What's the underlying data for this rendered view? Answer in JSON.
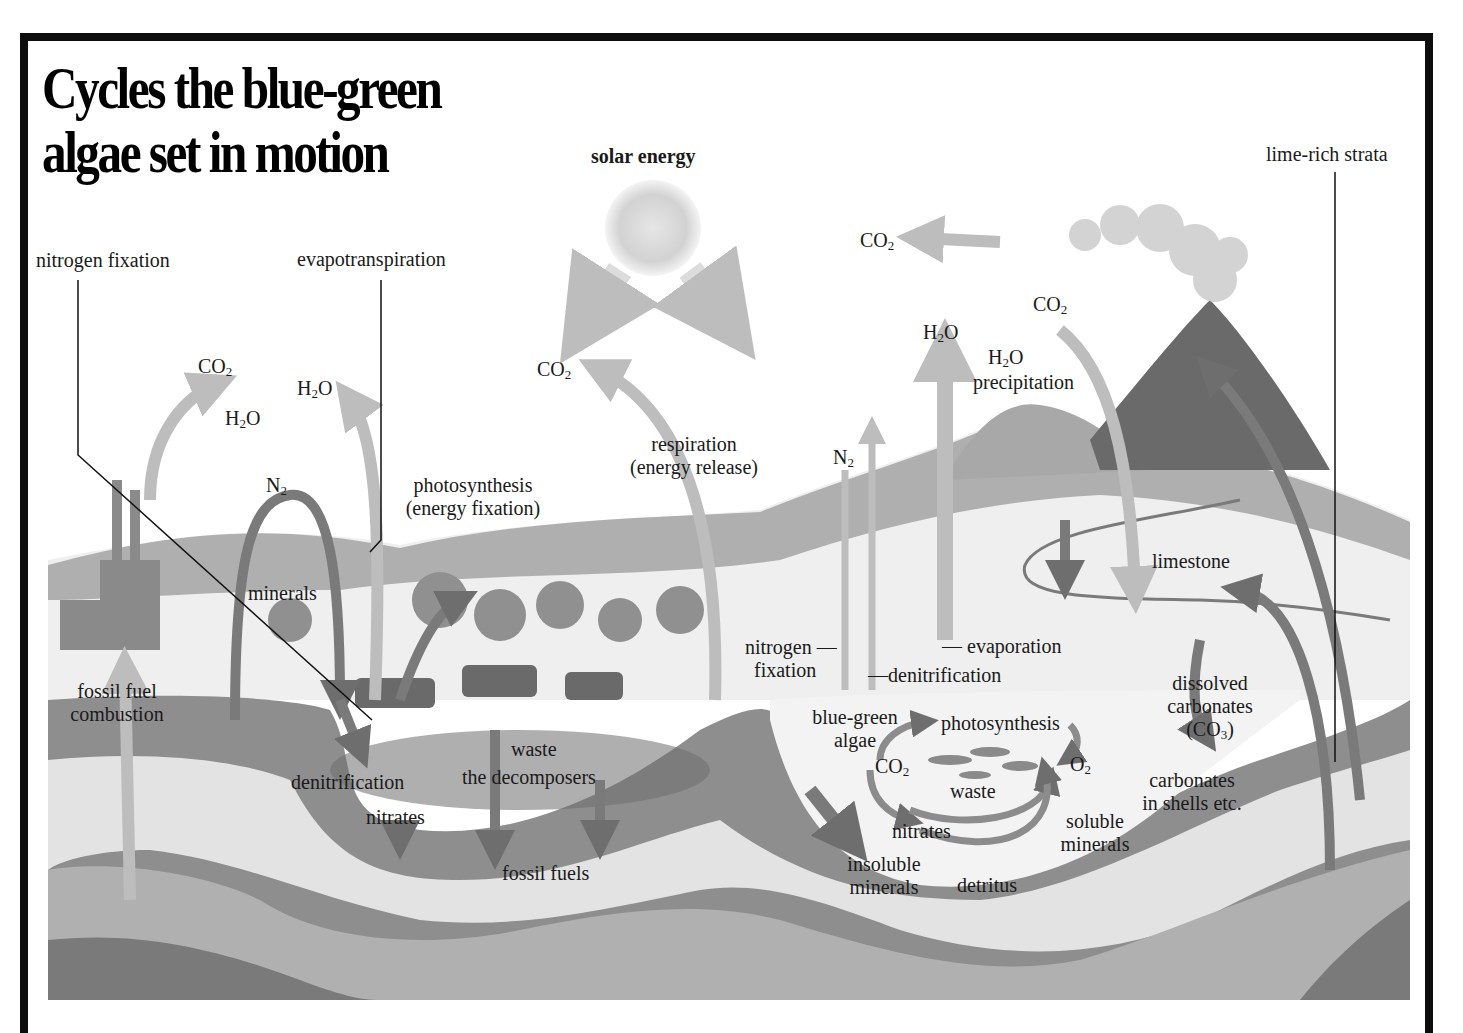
{
  "title": {
    "line1": "Cycles the blue-green",
    "line2": "algae set in motion"
  },
  "callouts": {
    "nitrogen_fixation_top": "nitrogen fixation",
    "evapotranspiration": "evapotranspiration",
    "solar_energy": "solar energy",
    "lime_rich_strata": "lime-rich strata"
  },
  "labels": {
    "co2_factory": {
      "base": "CO",
      "sub": "2"
    },
    "h2o_factory": {
      "base": "H",
      "sub": "2",
      "tail": "O"
    },
    "h2o_evapotranspiration": {
      "base": "H",
      "sub": "2",
      "tail": "O"
    },
    "n2_left": {
      "base": "N",
      "sub": "2"
    },
    "minerals": "minerals",
    "photosynthesis_land_1": "photosynthesis",
    "photosynthesis_land_2": "(energy fixation)",
    "co2_respiration": {
      "base": "CO",
      "sub": "2"
    },
    "respiration_1": "respiration",
    "respiration_2": "(energy release)",
    "co2_volcano_plume": {
      "base": "CO",
      "sub": "2"
    },
    "co2_volcano": {
      "base": "CO",
      "sub": "2"
    },
    "h2o_evaporation": {
      "base": "H",
      "sub": "2",
      "tail": "O"
    },
    "h2o_precipitation": {
      "base": "H",
      "sub": "2",
      "tail": "O"
    },
    "precipitation": "precipitation",
    "n2_right": {
      "base": "N",
      "sub": "2"
    },
    "limestone": "limestone",
    "fossil_fuel_combustion_1": "fossil fuel",
    "fossil_fuel_combustion_2": "combustion",
    "nitrogen_fixation_lake_1": "nitrogen —",
    "nitrogen_fixation_lake_2": "fixation",
    "evaporation": "— evaporation",
    "denitrification_lake": "—denitrification",
    "blue_green_algae_1": "blue-green",
    "blue_green_algae_2": "algae",
    "photosynthesis_lake": "photosynthesis",
    "co2_lake": {
      "base": "CO",
      "sub": "2"
    },
    "o2_lake": {
      "base": "O",
      "sub": "2"
    },
    "waste_lake": "waste",
    "nitrates_lake": "nitrates",
    "soluble_minerals_1": "soluble",
    "soluble_minerals_2": "minerals",
    "insoluble_minerals_1": "insoluble",
    "insoluble_minerals_2": "minerals",
    "detritus": "detritus",
    "dissolved_carbonates_1": "dissolved",
    "dissolved_carbonates_2": "carbonates",
    "dissolved_carbonates_3": {
      "base": "(CO",
      "sub": "3",
      "tail": ")"
    },
    "carbonates_shells_1": "carbonates",
    "carbonates_shells_2": "in shells etc.",
    "denitrification_soil": "denitrification",
    "waste_soil": "waste",
    "decomposers": "the decomposers",
    "nitrates_soil": "nitrates",
    "fossil_fuels": "fossil fuels"
  },
  "colors": {
    "frame": "#0d0d0d",
    "arrow_dark": "#6e6e6e",
    "arrow_light": "#b9b9b9",
    "strata_dark": "#8a8a8a",
    "strata_mid": "#b5b5b5",
    "strata_light": "#e4e4e4",
    "foliage": "#8f8f8f"
  }
}
